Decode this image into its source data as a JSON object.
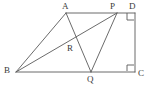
{
  "figure": {
    "canvas": {
      "width": 152,
      "height": 88
    },
    "style": {
      "background_color": "#ffffff",
      "stroke_color": "#5a5a5a",
      "label_color": "#3a3a3a",
      "stroke_width": 0.9
    },
    "points": [
      {
        "id": "A",
        "label": "A",
        "x": 66,
        "y": 13,
        "label_x": 62,
        "label_y": 2,
        "label_anchor": "above"
      },
      {
        "id": "P",
        "label": "P",
        "x": 117,
        "y": 13,
        "label_x": 110,
        "label_y": 2,
        "label_anchor": "above"
      },
      {
        "id": "D",
        "label": "D",
        "x": 135,
        "y": 13,
        "label_x": 129,
        "label_y": 2,
        "label_anchor": "above"
      },
      {
        "id": "C",
        "label": "C",
        "x": 135,
        "y": 72,
        "label_x": 138,
        "label_y": 69,
        "label_anchor": "right"
      },
      {
        "id": "Q",
        "label": "Q",
        "x": 91,
        "y": 72,
        "label_x": 87,
        "label_y": 75,
        "label_anchor": "below"
      },
      {
        "id": "B",
        "label": "B",
        "x": 16,
        "y": 72,
        "label_x": 4,
        "label_y": 66,
        "label_anchor": "left"
      },
      {
        "id": "R",
        "label": "R",
        "x": 72,
        "y": 41,
        "label_x": 67,
        "label_y": 44,
        "label_anchor": "below-left"
      }
    ],
    "segments": [
      {
        "id": "AD",
        "from": "A",
        "to": "D",
        "description": "top-side"
      },
      {
        "id": "BC",
        "from": "B",
        "to": "C",
        "description": "bottom-side"
      },
      {
        "id": "DC",
        "from": "D",
        "to": "C",
        "description": "right-side"
      },
      {
        "id": "BA",
        "from": "B",
        "to": "A",
        "description": "left-slant-side"
      },
      {
        "id": "BP",
        "from": "B",
        "to": "P",
        "description": "diagonal-b-to-p"
      },
      {
        "id": "AQ",
        "from": "A",
        "to": "Q",
        "description": "cevian-a-to-q"
      },
      {
        "id": "PQ",
        "from": "P",
        "to": "Q",
        "description": "cevian-p-to-q"
      }
    ],
    "right_angles": [
      {
        "id": "angle-D",
        "at": "D",
        "x": 127,
        "y": 13,
        "size": 7,
        "direction": "down-left"
      },
      {
        "id": "angle-C",
        "at": "C",
        "x": 127,
        "y": 65,
        "size": 7,
        "direction": "up-left"
      }
    ],
    "intersection_note": "R is the intersection of segment BP and segment AQ"
  }
}
